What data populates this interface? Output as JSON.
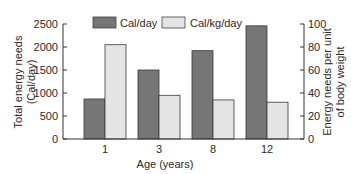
{
  "chart_data": {
    "type": "bar",
    "title": "",
    "categories": [
      "1",
      "3",
      "8",
      "12"
    ],
    "xlabel": "Age (years)",
    "series": [
      {
        "name": "Cal/day",
        "axis": "left",
        "color": "#767676",
        "values": [
          870,
          1500,
          1920,
          2460
        ]
      },
      {
        "name": "Cal/kg/day",
        "axis": "right",
        "color": "#e4e4e4",
        "values": [
          82,
          38,
          34,
          32
        ]
      }
    ],
    "ylabel_left": [
      "Total energy needs",
      "(Cal/day)"
    ],
    "ylabel_right": [
      "Energy needs per unit",
      "of body weight"
    ],
    "ylim_left": [
      0,
      2500
    ],
    "ylim_right": [
      0,
      100
    ],
    "yticks_left": [
      0,
      500,
      1000,
      1500,
      2000,
      2500
    ],
    "yticks_right": [
      0,
      20,
      40,
      60,
      80,
      100
    ],
    "grid": false,
    "legend_position": "top-inside"
  }
}
